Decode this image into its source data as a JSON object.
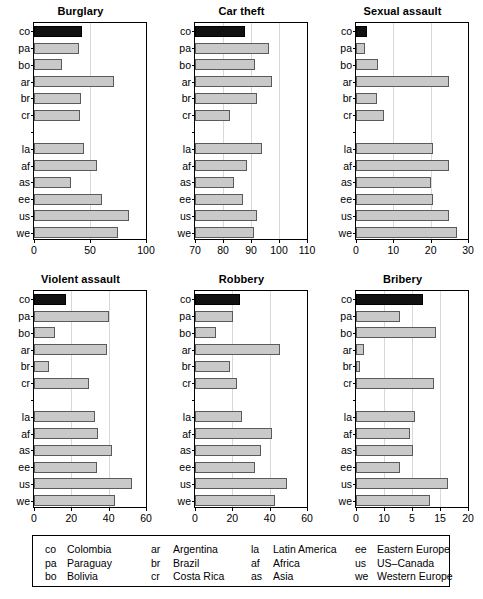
{
  "figure": {
    "kind": "small-multiples-bar-chart-grid",
    "rows": 2,
    "cols": 3,
    "highlight_color": "#111111",
    "bar_color": "#c9c9c9",
    "bar_edge_color": "#5a5a5a",
    "gridline_color": "#d8d8d8",
    "highlight_category": "co"
  },
  "categories": [
    "co",
    "pa",
    "bo",
    "ar",
    "br",
    "cr",
    "",
    "la",
    "af",
    "as",
    "ee",
    "us",
    "we"
  ],
  "legend": {
    "columns": [
      {
        "entries": [
          {
            "abbr": "co",
            "name": "Colombia"
          },
          {
            "abbr": "pa",
            "name": "Paraguay"
          },
          {
            "abbr": "bo",
            "name": "Bolivia"
          }
        ]
      },
      {
        "entries": [
          {
            "abbr": "ar",
            "name": "Argentina"
          },
          {
            "abbr": "br",
            "name": "Brazil"
          },
          {
            "abbr": "cr",
            "name": "Costa Rica"
          }
        ]
      },
      {
        "entries": [
          {
            "abbr": "la",
            "name": "Latin America"
          },
          {
            "abbr": "af",
            "name": "Africa"
          },
          {
            "abbr": "as",
            "name": "Asia"
          }
        ]
      },
      {
        "entries": [
          {
            "abbr": "ee",
            "name": "Eastern Europe"
          },
          {
            "abbr": "us",
            "name": "US–Canada"
          },
          {
            "abbr": "we",
            "name": "Western Europe"
          }
        ]
      }
    ]
  },
  "chart_data": [
    {
      "type": "bar",
      "orientation": "horizontal",
      "title": "Burglary",
      "xlabel": "",
      "ylabel": "",
      "xlim": [
        0,
        100
      ],
      "xticks": [
        0,
        50,
        100
      ],
      "xtick_labels": [
        "0",
        "50",
        "100"
      ],
      "grid": true,
      "categories": [
        "co",
        "pa",
        "bo",
        "ar",
        "br",
        "cr",
        "la",
        "af",
        "as",
        "ee",
        "us",
        "we"
      ],
      "values": [
        43,
        40,
        25,
        71,
        42,
        41,
        45,
        56,
        33,
        61,
        85,
        75
      ],
      "highlight": [
        "co"
      ]
    },
    {
      "type": "bar",
      "orientation": "horizontal",
      "title": "Car theft",
      "xlabel": "",
      "ylabel": "",
      "xlim": [
        70,
        110
      ],
      "xticks": [
        70,
        80,
        90,
        100,
        110
      ],
      "xtick_labels": [
        "70",
        "80",
        "90",
        "100",
        "110"
      ],
      "grid": true,
      "categories": [
        "co",
        "pa",
        "bo",
        "ar",
        "br",
        "cr",
        "la",
        "af",
        "as",
        "ee",
        "us",
        "we"
      ],
      "values": [
        88,
        96.5,
        91.5,
        97.5,
        92,
        82.5,
        94,
        88.5,
        84,
        87,
        92,
        91
      ],
      "highlight": [
        "co"
      ]
    },
    {
      "type": "bar",
      "orientation": "horizontal",
      "title": "Sexual assault",
      "xlabel": "",
      "ylabel": "",
      "xlim": [
        0,
        30
      ],
      "xticks": [
        0,
        10,
        20,
        30
      ],
      "xtick_labels": [
        "0",
        "10",
        "20",
        "30"
      ],
      "grid": true,
      "categories": [
        "co",
        "pa",
        "bo",
        "ar",
        "br",
        "cr",
        "la",
        "af",
        "as",
        "ee",
        "us",
        "we"
      ],
      "values": [
        3,
        2.5,
        6,
        25,
        5.5,
        7.5,
        20.5,
        25,
        20,
        20.5,
        25,
        27
      ],
      "highlight": [
        "co"
      ]
    },
    {
      "type": "bar",
      "orientation": "horizontal",
      "title": "Violent assault",
      "xlabel": "",
      "ylabel": "",
      "xlim": [
        0,
        60
      ],
      "xticks": [
        0,
        20,
        40,
        60
      ],
      "xtick_labels": [
        "0",
        "20",
        "40",
        "60"
      ],
      "grid": true,
      "categories": [
        "co",
        "pa",
        "bo",
        "ar",
        "br",
        "cr",
        "la",
        "af",
        "as",
        "ee",
        "us",
        "we"
      ],
      "values": [
        17,
        40,
        11,
        39,
        8,
        29.5,
        32.5,
        34.5,
        42,
        34,
        52.5,
        43.5
      ],
      "highlight": [
        "co"
      ]
    },
    {
      "type": "bar",
      "orientation": "horizontal",
      "title": "Robbery",
      "xlabel": "",
      "ylabel": "",
      "xlim": [
        0,
        60
      ],
      "xticks": [
        0,
        20,
        40,
        60
      ],
      "xtick_labels": [
        "0",
        "20",
        "40",
        "60"
      ],
      "grid": true,
      "categories": [
        "co",
        "pa",
        "bo",
        "ar",
        "br",
        "cr",
        "la",
        "af",
        "as",
        "ee",
        "us",
        "we"
      ],
      "values": [
        24,
        20.5,
        11.5,
        45.5,
        18.5,
        22.5,
        25,
        41,
        35.5,
        32,
        49.5,
        43
      ],
      "highlight": [
        "co"
      ]
    },
    {
      "type": "bar",
      "orientation": "horizontal",
      "title": "Bribery",
      "xlabel": "",
      "ylabel": "",
      "xlim": [
        0,
        20
      ],
      "xticks": [
        0,
        5,
        10,
        15,
        20
      ],
      "xtick_labels": [
        "0",
        "10",
        "5",
        "15",
        "20"
      ],
      "grid": true,
      "categories": [
        "co",
        "pa",
        "bo",
        "ar",
        "br",
        "cr",
        "la",
        "af",
        "as",
        "ee",
        "us",
        "we"
      ],
      "values": [
        12,
        7.8,
        14.2,
        1.5,
        0.8,
        13.9,
        10.5,
        9.6,
        10.2,
        7.8,
        16.5,
        13.3
      ],
      "highlight": [
        "co"
      ]
    }
  ]
}
